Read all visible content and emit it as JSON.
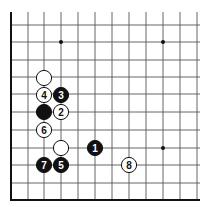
{
  "board": {
    "description": "Go board corner diagram (lower-left corner)",
    "columns_x": [
      11,
      28,
      44,
      61,
      78,
      95,
      112,
      129,
      146,
      163,
      180,
      197
    ],
    "rows_y": [
      25,
      42,
      60,
      77,
      94,
      112,
      130,
      148,
      165,
      183
    ],
    "top_y": 12,
    "right_x": 200,
    "left_edge_x": 11,
    "bottom_edge_y": 200,
    "grid_color": "#555555",
    "edge_color": "#111111",
    "star_points": [
      {
        "x": 61,
        "y": 42
      },
      {
        "x": 163,
        "y": 42
      },
      {
        "x": 163,
        "y": 148
      }
    ]
  },
  "stones": [
    {
      "color": "white",
      "x": 44,
      "y": 78,
      "label": ""
    },
    {
      "color": "white",
      "x": 44,
      "y": 95,
      "label": "4"
    },
    {
      "color": "black",
      "x": 61,
      "y": 95,
      "label": "3"
    },
    {
      "color": "black",
      "x": 44,
      "y": 112,
      "label": ""
    },
    {
      "color": "white",
      "x": 61,
      "y": 112,
      "label": "2"
    },
    {
      "color": "white",
      "x": 44,
      "y": 130,
      "label": "6"
    },
    {
      "color": "white",
      "x": 61,
      "y": 148,
      "label": ""
    },
    {
      "color": "black",
      "x": 95,
      "y": 148,
      "label": "1"
    },
    {
      "color": "black",
      "x": 44,
      "y": 165,
      "label": "7"
    },
    {
      "color": "black",
      "x": 61,
      "y": 165,
      "label": "5"
    },
    {
      "color": "white",
      "x": 129,
      "y": 165,
      "label": "8"
    }
  ]
}
